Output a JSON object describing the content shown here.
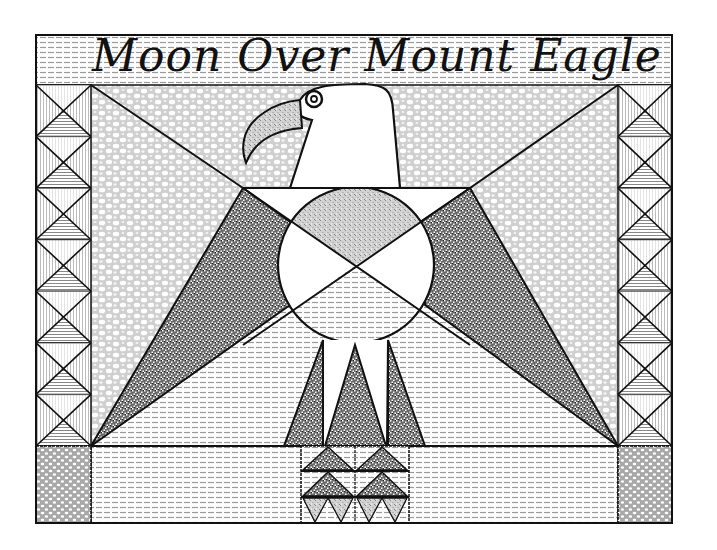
{
  "title": "Moon Over Mount Eagle",
  "colors": {
    "line": "#111111",
    "background": "#ffffff",
    "pebble_fill": "#d6d6d6",
    "stripe_fill": "#9a9a9a",
    "speckle_fill": "#555555",
    "light_speckle": "#c8c8c8"
  },
  "frame": {
    "left": 36,
    "top": 35,
    "right": 672,
    "bottom": 523
  },
  "elements": {
    "title_band": "Title band with horizontal stripe texture",
    "left_column": "Column of hourglass triangle blocks",
    "right_column": "Column of hourglass triangle blocks",
    "eagle_head": "Eagle head with eye and beak",
    "moon": "Circle divided into four segments",
    "wings": "Two speckled triangular wings",
    "legs": "Three speckled triangular legs",
    "base": "Grid of sawtooth triangles",
    "corner_blocks": "Pebble textured bottom corner blocks"
  }
}
